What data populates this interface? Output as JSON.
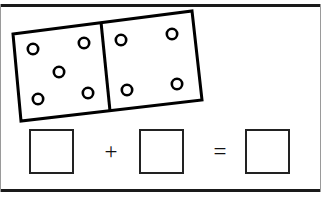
{
  "worksheet": {
    "title": "Domino Addition Worksheet",
    "width": 321,
    "height": 198,
    "background_color": "#ffffff",
    "line_color": "#1a1a1a"
  },
  "domino": {
    "name": "domino-tile",
    "rotation_degrees": -9,
    "outline_color": "#000000",
    "fill_color": "#ffffff",
    "stroke_width": 3,
    "corners": {
      "top_left": [
        13,
        34
      ],
      "top_right": [
        192,
        11
      ],
      "bottom_right": [
        202,
        100
      ],
      "bottom_left": [
        21,
        121
      ]
    },
    "divider": {
      "from": [
        101,
        22
      ],
      "to": [
        110,
        111
      ]
    },
    "left_half": {
      "pip_count": 5,
      "pattern": "quincunx",
      "pips": [
        {
          "cx": 33,
          "cy": 49
        },
        {
          "cx": 84,
          "cy": 43
        },
        {
          "cx": 59,
          "cy": 72
        },
        {
          "cx": 38,
          "cy": 99
        },
        {
          "cx": 88,
          "cy": 93
        }
      ]
    },
    "right_half": {
      "pip_count": 4,
      "pattern": "square",
      "pips": [
        {
          "cx": 121,
          "cy": 40
        },
        {
          "cx": 172,
          "cy": 34
        },
        {
          "cx": 127,
          "cy": 90
        },
        {
          "cx": 177,
          "cy": 84
        }
      ]
    },
    "pip_style": {
      "radius": 5.2,
      "stroke_width": 2.6,
      "stroke_color": "#000000",
      "fill_color": "#ffffff"
    }
  },
  "equation": {
    "name": "addition-equation",
    "addend_1_value": "",
    "operator_plus": "+",
    "addend_2_value": "",
    "operator_equals": "=",
    "sum_value": "",
    "box_border_color": "#222222"
  }
}
